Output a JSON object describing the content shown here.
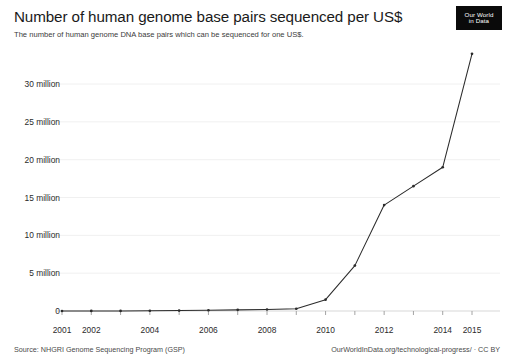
{
  "header": {
    "title": "Number of human genome base pairs sequenced per US$",
    "subtitle": "The number of human genome DNA base pairs which can be sequenced for one US$.",
    "logo_line1": "Our World",
    "logo_line2": "in Data"
  },
  "footer": {
    "source": "Source: NHGRI Genome Sequencing Program (GSP)",
    "attribution": "OurWorldInData.org/technological-progress/ · CC BY"
  },
  "chart_data": {
    "type": "line",
    "title": "Number of human genome base pairs sequenced per US$",
    "subtitle": "The number of human genome DNA base pairs which can be sequenced for one US$.",
    "xlabel": "",
    "ylabel": "",
    "x": [
      2001,
      2002,
      2003,
      2004,
      2005,
      2006,
      2007,
      2008,
      2009,
      2010,
      2011,
      2012,
      2013,
      2014,
      2015
    ],
    "values": [
      1000,
      4000,
      10000,
      30000,
      60000,
      100000,
      150000,
      200000,
      300000,
      1500000,
      6000000,
      14000000,
      16500000,
      19000000,
      34000000
    ],
    "series": [
      {
        "name": "Base pairs per US$",
        "values": [
          1000,
          4000,
          10000,
          30000,
          60000,
          100000,
          150000,
          200000,
          300000,
          1500000,
          6000000,
          14000000,
          16500000,
          19000000,
          34000000
        ]
      }
    ],
    "xlim": [
      2001,
      2015
    ],
    "ylim": [
      0,
      34500000
    ],
    "grid": true,
    "legend": false,
    "line_color": "#2b2b2b",
    "marker": "dot",
    "x_ticks": [
      "2001",
      "2002",
      "2004",
      "2006",
      "2008",
      "2010",
      "2012",
      "2014",
      "2015"
    ],
    "x_tick_values": [
      2001,
      2002,
      2004,
      2006,
      2008,
      2010,
      2012,
      2014,
      2015
    ],
    "y_ticks": [
      "0",
      "5 million",
      "10 million",
      "15 million",
      "20 million",
      "25 million",
      "30 million"
    ],
    "y_tick_values": [
      0,
      5000000,
      10000000,
      15000000,
      20000000,
      25000000,
      30000000
    ]
  }
}
